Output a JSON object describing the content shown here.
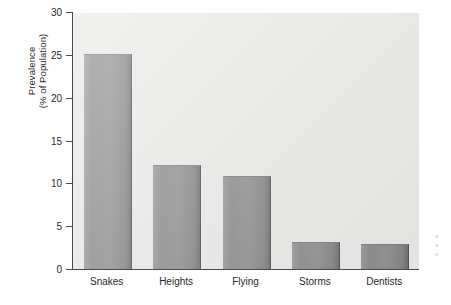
{
  "chart_data": {
    "type": "bar",
    "title": "",
    "xlabel": "",
    "ylabel_line1": "Prevalence",
    "ylabel_line2": "(% of Population)",
    "categories": [
      "Snakes",
      "Heights",
      "Flying",
      "Storms",
      "Dentists"
    ],
    "values": [
      25.1,
      12.1,
      10.8,
      3.2,
      2.9
    ],
    "ylim": [
      0,
      30
    ],
    "yticks": [
      0,
      5,
      10,
      15,
      20,
      25,
      30
    ],
    "ytick_labels": [
      "0",
      "5",
      "10",
      "15",
      "20",
      "25",
      "30"
    ],
    "grid": false,
    "legend": null,
    "bar_color": "#8b8b8b",
    "plot_background": "#e9e9e7",
    "axis_color": "#4a4a4a"
  },
  "margin_note": {
    "line1": "a",
    "line2": "a",
    "line3": "s"
  }
}
